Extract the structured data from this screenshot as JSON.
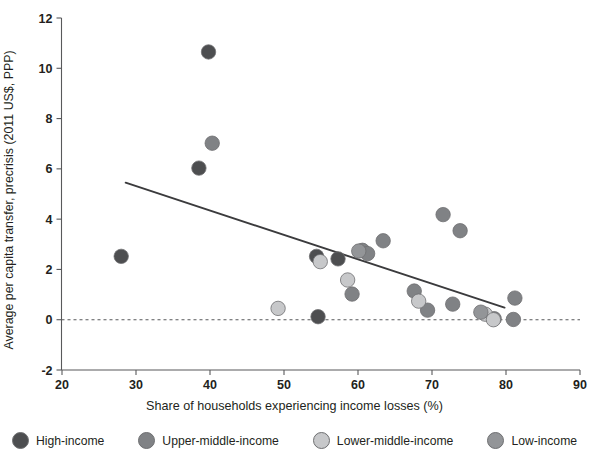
{
  "chart_data": {
    "type": "scatter",
    "title": "",
    "xlabel": "Share of households experiencing income losses (%)",
    "ylabel": "Average per capita transfer, precrisis (2011 US$, PPP)",
    "xlim": [
      15,
      90
    ],
    "ylim": [
      -2,
      12
    ],
    "xticks": [
      20,
      30,
      40,
      50,
      60,
      70,
      80,
      90
    ],
    "yticks": [
      -2,
      0,
      2,
      4,
      6,
      8,
      10,
      12
    ],
    "grid": false,
    "legend_position": "bottom",
    "reference_line": {
      "y": 0,
      "style": "dotted"
    },
    "trend_line": {
      "x0": 28.6,
      "y0": 5.45,
      "x1": 79.8,
      "y1": 0.48,
      "style": "solid"
    },
    "groups": [
      {
        "key": "high",
        "label": "High-income",
        "color": "#4d4e50"
      },
      {
        "key": "upper_middle",
        "label": "Upper-middle-income",
        "color": "#808285"
      },
      {
        "key": "lower_middle",
        "label": "Lower-middle-income",
        "color": "#c7c8ca"
      },
      {
        "key": "low",
        "label": "Low-income",
        "color": "#939598"
      }
    ],
    "series": [
      {
        "name": "High-income",
        "group": "high",
        "color": "#4d4e50",
        "points": [
          {
            "x": 28.0,
            "y": 2.52
          },
          {
            "x": 39.8,
            "y": 10.65
          },
          {
            "x": 38.5,
            "y": 6.03
          },
          {
            "x": 54.4,
            "y": 2.52
          },
          {
            "x": 54.6,
            "y": 0.12
          },
          {
            "x": 57.3,
            "y": 2.42
          }
        ]
      },
      {
        "name": "Upper-middle-income",
        "group": "upper_middle",
        "color": "#808285",
        "points": [
          {
            "x": 40.3,
            "y": 7.02
          },
          {
            "x": 59.2,
            "y": 1.02
          },
          {
            "x": 60.6,
            "y": 2.76
          },
          {
            "x": 61.3,
            "y": 2.63
          },
          {
            "x": 63.4,
            "y": 3.14
          },
          {
            "x": 67.6,
            "y": 1.14
          },
          {
            "x": 71.5,
            "y": 4.18
          },
          {
            "x": 73.8,
            "y": 3.54
          },
          {
            "x": 72.8,
            "y": 0.62
          },
          {
            "x": 69.4,
            "y": 0.38
          },
          {
            "x": 78.4,
            "y": 0.04
          },
          {
            "x": 81.2,
            "y": 0.86
          },
          {
            "x": 81.0,
            "y": 0.01
          }
        ]
      },
      {
        "name": "Lower-middle-income",
        "group": "lower_middle",
        "color": "#c7c8ca",
        "points": [
          {
            "x": 49.2,
            "y": 0.45
          },
          {
            "x": 54.9,
            "y": 2.31
          },
          {
            "x": 58.6,
            "y": 1.58
          },
          {
            "x": 68.2,
            "y": 0.74
          },
          {
            "x": 77.2,
            "y": 0.22
          },
          {
            "x": 78.3,
            "y": 0.0
          }
        ]
      },
      {
        "name": "Low-income",
        "group": "low",
        "color": "#939598",
        "points": [
          {
            "x": 60.1,
            "y": 2.73
          },
          {
            "x": 76.6,
            "y": 0.3
          }
        ]
      }
    ]
  }
}
